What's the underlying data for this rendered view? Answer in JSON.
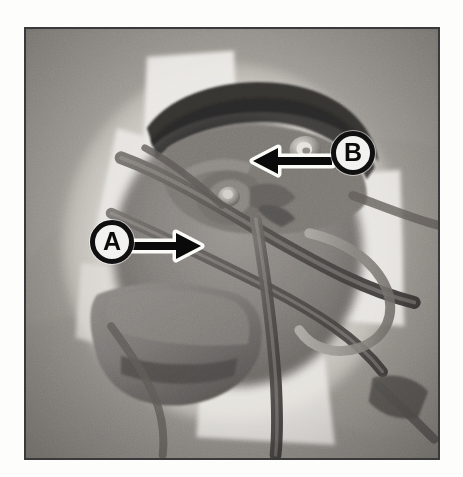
{
  "figure": {
    "type": "photograph",
    "style": "grayscale halftone reference photo",
    "frame": {
      "border_color": "#3a3a3a",
      "background_color": "#ffffff",
      "photo_base_color": "#8e8e8e"
    },
    "caption": ""
  },
  "callouts": [
    {
      "id": "a",
      "label": "A",
      "arrow_direction": "right",
      "ring_color": "#101010",
      "fill_color": "#f2f2f0",
      "text_color": "#0b0b0b"
    },
    {
      "id": "b",
      "label": "B",
      "arrow_direction": "left",
      "ring_color": "#101010",
      "fill_color": "#f2f2f0",
      "text_color": "#0b0b0b"
    }
  ],
  "palette": {
    "highlight": "#f4f3ef",
    "light_gray": "#c8c6c0",
    "mid_gray": "#9b9893",
    "dark_gray": "#6a6763",
    "shadow": "#3e3c39",
    "deep_shadow": "#232220",
    "arrow_black": "#0a0a0a",
    "arrow_halo": "#fbfbf8"
  }
}
